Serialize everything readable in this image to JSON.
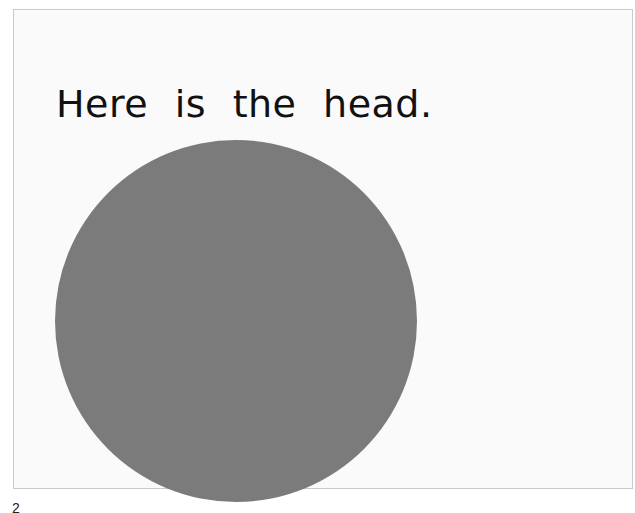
{
  "page": {
    "caption": "Here is the head.",
    "page_number": "2",
    "illustration": {
      "shape": "circle",
      "label": "head",
      "color": "#7b7b7b"
    },
    "colors": {
      "background": "#fafafa",
      "border": "#c9c9c9",
      "text": "#111111"
    }
  }
}
